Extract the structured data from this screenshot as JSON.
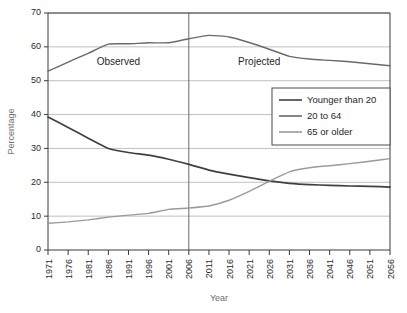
{
  "chart_data": {
    "type": "line",
    "title": "",
    "xlabel": "Year",
    "ylabel": "Percentage",
    "xlim": [
      1971,
      2056
    ],
    "ylim": [
      0,
      70
    ],
    "ytick_step": 10,
    "xtick_step": 5,
    "grid": "horizontal",
    "legend_position": "center-right",
    "x": [
      1971,
      1976,
      1981,
      1986,
      1991,
      1996,
      2001,
      2006,
      2011,
      2016,
      2021,
      2026,
      2031,
      2036,
      2041,
      2046,
      2051,
      2056
    ],
    "xtick_labels": [
      "1971",
      "1976",
      "1981",
      "1986",
      "1991",
      "1996",
      "2001",
      "2006",
      "2011",
      "2016",
      "2021",
      "2026",
      "2031",
      "2036",
      "2041",
      "2046",
      "2051",
      "2056"
    ],
    "ytick_labels": [
      "0",
      "10",
      "20",
      "30",
      "40",
      "50",
      "60",
      "70"
    ],
    "series": [
      {
        "name": "Younger than 20",
        "color": "#404040",
        "values": [
          39.3,
          36.2,
          33.0,
          30.0,
          28.8,
          28.0,
          26.8,
          25.3,
          23.6,
          22.4,
          21.4,
          20.4,
          19.7,
          19.3,
          19.1,
          18.9,
          18.8,
          18.6
        ]
      },
      {
        "name": "20 to 64",
        "color": "#6a6a6a",
        "values": [
          52.8,
          55.5,
          58.1,
          60.8,
          60.9,
          61.2,
          61.2,
          62.4,
          63.4,
          62.9,
          61.3,
          59.3,
          57.2,
          56.4,
          56.0,
          55.6,
          55.0,
          54.4
        ]
      },
      {
        "name": "65 or older",
        "color": "#9a9a9a",
        "values": [
          7.9,
          8.3,
          8.9,
          9.7,
          10.3,
          10.8,
          12.0,
          12.4,
          13.0,
          14.7,
          17.3,
          20.3,
          23.1,
          24.3,
          24.9,
          25.5,
          26.2,
          27.0
        ]
      }
    ],
    "annotations": [
      {
        "text": "Observed",
        "x_center": 1988.5,
        "y_value": 55.5
      },
      {
        "text": "Projected",
        "x_center": 2023.5,
        "y_value": 55.5
      }
    ],
    "divider": {
      "x_value": 2006,
      "label": "observed-projected-divider"
    }
  }
}
